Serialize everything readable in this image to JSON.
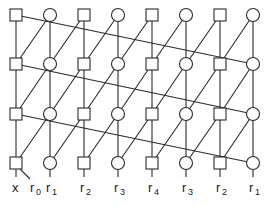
{
  "diagram": {
    "type": "lattice-filter-structure",
    "columns_x": [
      16,
      50,
      84,
      118,
      152,
      186,
      220,
      253
    ],
    "rows_y": [
      15,
      64,
      114,
      163
    ],
    "node_types": [
      "square",
      "circle",
      "square",
      "circle",
      "square",
      "circle",
      "square",
      "circle"
    ],
    "node_size": 12,
    "stroke_color": "#2a2a2a",
    "bottom_labels": [
      {
        "col": 0,
        "text": "x",
        "sub": ""
      },
      {
        "col": 0,
        "text": "r",
        "sub": "0",
        "offset": 1
      },
      {
        "col": 1,
        "text": "r",
        "sub": "1"
      },
      {
        "col": 2,
        "text": "r",
        "sub": "2"
      },
      {
        "col": 3,
        "text": "r",
        "sub": "3"
      },
      {
        "col": 4,
        "text": "r",
        "sub": "4"
      },
      {
        "col": 5,
        "text": "r",
        "sub": "3"
      },
      {
        "col": 6,
        "text": "r",
        "sub": "2"
      },
      {
        "col": 7,
        "text": "r",
        "sub": "1"
      }
    ],
    "labels_text": [
      "x",
      "r0",
      "r1",
      "r2",
      "r3",
      "r4",
      "r3",
      "r2",
      "r1"
    ]
  }
}
